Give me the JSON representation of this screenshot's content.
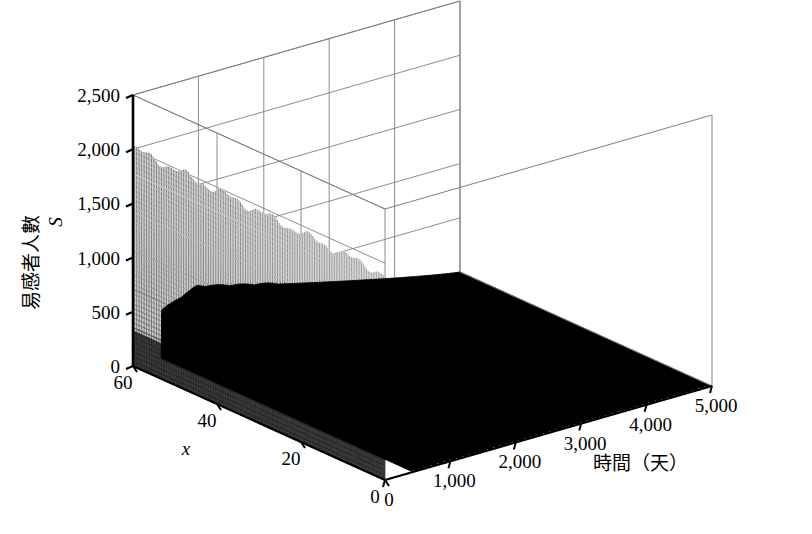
{
  "figure": {
    "kind": "3d-surface-mesh",
    "background": "#ffffff",
    "line_color": "#808080",
    "axis_color": "#000000",
    "mesh_light": "#9a9a9a",
    "mesh_dark": "#000000"
  },
  "chart_data": {
    "type": "surface",
    "title": "",
    "xlabel": "x",
    "ylabel": "時間（天）",
    "zlabel": "易感者人數 S",
    "zlabel_text": "易感者人數",
    "zlabel_var": "S",
    "xlim": [
      0,
      60
    ],
    "ylim": [
      0,
      5000
    ],
    "zlim": [
      0,
      2500
    ],
    "x_ticks": [
      60,
      40,
      20,
      0
    ],
    "x_tick_labels": [
      "60",
      "40",
      "20",
      "0"
    ],
    "y_ticks": [
      0,
      1000,
      2000,
      3000,
      4000,
      5000
    ],
    "y_tick_labels": [
      "0",
      "1,000",
      "2,000",
      "3,000",
      "4,000",
      "5,000"
    ],
    "z_ticks": [
      0,
      500,
      1000,
      1500,
      2000,
      2500
    ],
    "z_tick_labels": [
      "0",
      "500",
      "1,000",
      "1,500",
      "2,000",
      "2,500"
    ],
    "grid": true,
    "legend": null,
    "surface_notes": {
      "wall_peak_value": 2000,
      "wall_time_extent": [
        0,
        430
      ],
      "dark_ridge_peak_value": 560,
      "dark_region_time_extent": [
        430,
        5000
      ]
    }
  },
  "axes": {
    "z_axis_name": "susceptible-count-axis",
    "x_axis_name": "spatial-x-axis",
    "y_axis_name": "time-days-axis"
  }
}
